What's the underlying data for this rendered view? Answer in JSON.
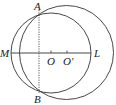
{
  "diagram": {
    "type": "geometry",
    "colors": {
      "stroke": "#333333",
      "label": "#222222",
      "background": "#ffffff"
    },
    "points": {
      "A": {
        "label": "A",
        "x": 39,
        "y": 10
      },
      "B": {
        "label": "B",
        "x": 39,
        "y": 93
      },
      "M": {
        "label": "M",
        "x": 11,
        "y": 53
      },
      "L": {
        "label": "L",
        "x": 91,
        "y": 53
      },
      "O": {
        "label": "O",
        "x": 51,
        "y": 53
      },
      "O_prime": {
        "label": "O'",
        "x": 67,
        "y": 53
      }
    },
    "circles": [
      {
        "name": "circle-O",
        "center": "O",
        "cx": 51,
        "cy": 53,
        "r": 40
      },
      {
        "name": "circle-O-prime",
        "center": "O'",
        "cx": 66.5,
        "cy": 52.5,
        "r": 47
      }
    ],
    "segments": [
      {
        "name": "line-ML",
        "from": "M",
        "to": "L",
        "style": "solid"
      },
      {
        "name": "chord-AB",
        "from": "A",
        "to": "B",
        "style": "dashed"
      }
    ]
  }
}
